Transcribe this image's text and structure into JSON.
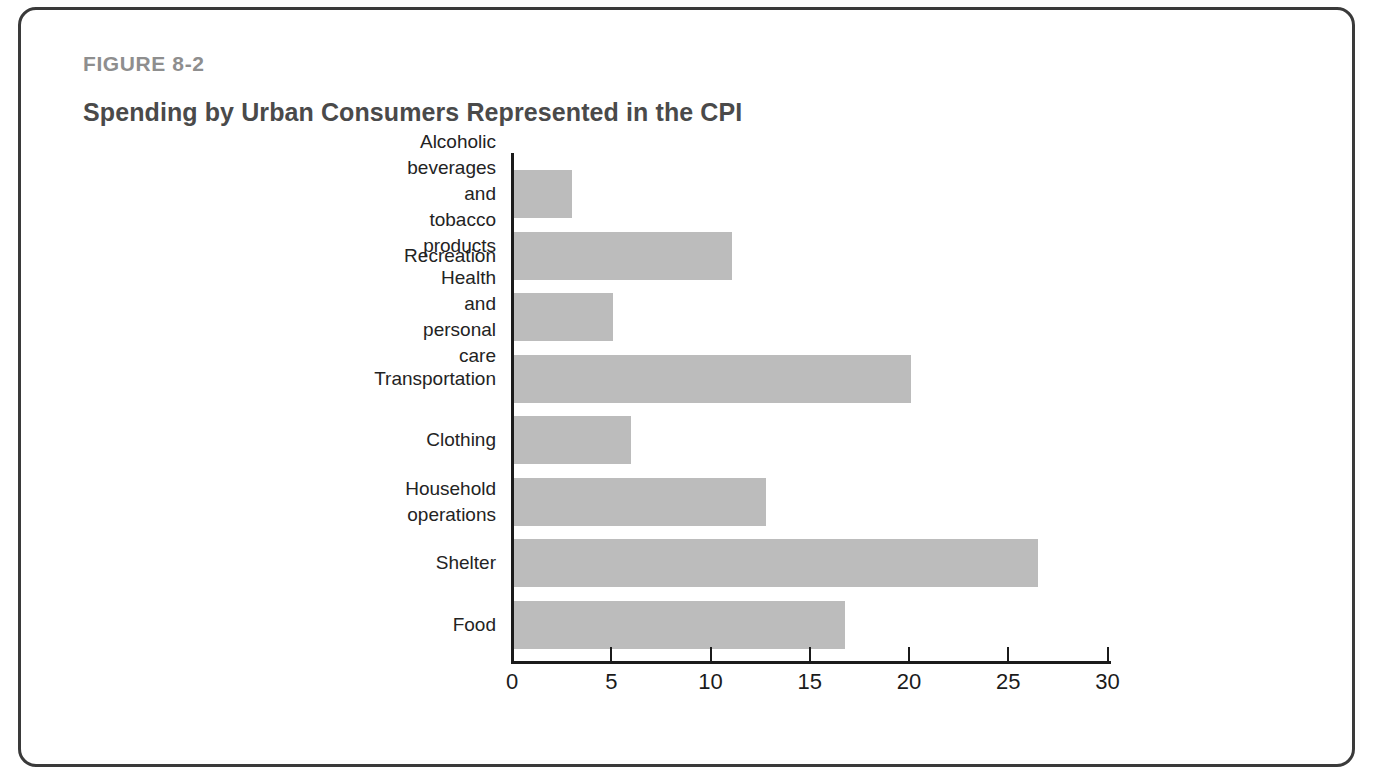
{
  "figure": {
    "number": "FIGURE 8-2",
    "title": "Spending by Urban Consumers Represented in the CPI"
  },
  "colors": {
    "bar_fill": "#bcbcbc",
    "axis": "#1b1b1b",
    "figure_number": "#8e8e8e",
    "title": "#4a4a4a",
    "frame_border": "#3a3a3a"
  },
  "chart_data": {
    "type": "bar",
    "orientation": "horizontal",
    "title": "Spending by Urban Consumers Represented in the CPI",
    "xlabel": "",
    "ylabel": "",
    "xlim": [
      0,
      30
    ],
    "xticks": [
      "0",
      "5",
      "10",
      "15",
      "20",
      "25",
      "30"
    ],
    "xtick_values": [
      0,
      5,
      10,
      15,
      20,
      25,
      30
    ],
    "grid": false,
    "legend": null,
    "categories": [
      "Alcoholic beverages and\ntobacco products",
      "Recreation",
      "Health and personal care",
      "Transportation",
      "Clothing",
      "Household operations",
      "Shelter",
      "Food"
    ],
    "values": [
      2.9,
      11.0,
      5.0,
      20.0,
      5.9,
      12.7,
      26.4,
      16.7
    ]
  }
}
